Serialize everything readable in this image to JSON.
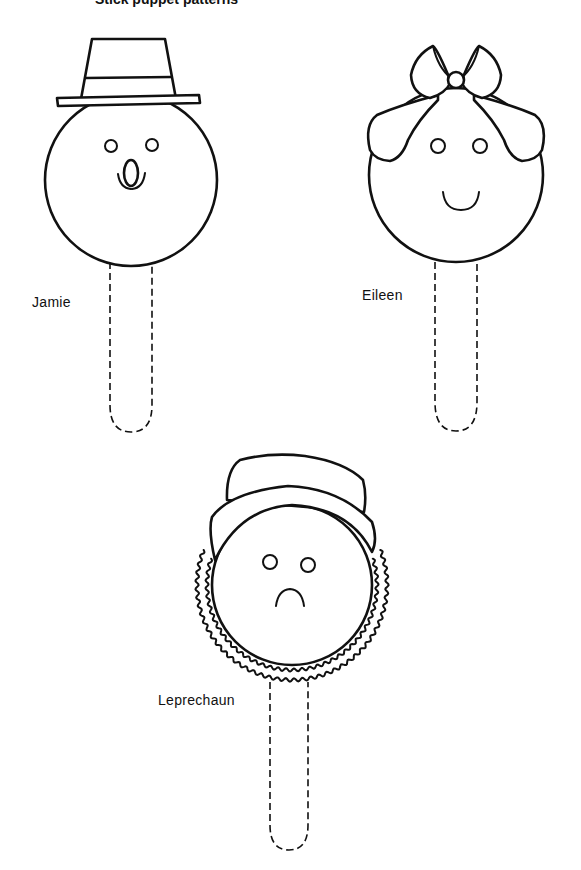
{
  "page": {
    "header_partial": "Stick puppet patterns"
  },
  "puppets": [
    {
      "name": "Jamie",
      "features": [
        "top-hat",
        "round-eyes",
        "oval-mouth",
        "whiskers"
      ]
    },
    {
      "name": "Eileen",
      "features": [
        "hair",
        "bow",
        "round-eyes",
        "smile"
      ]
    },
    {
      "name": "Leprechaun",
      "features": [
        "hat",
        "round-eyes",
        "frown",
        "wavy-beard"
      ]
    }
  ],
  "colors": {
    "line": "#111111",
    "background": "#ffffff"
  }
}
